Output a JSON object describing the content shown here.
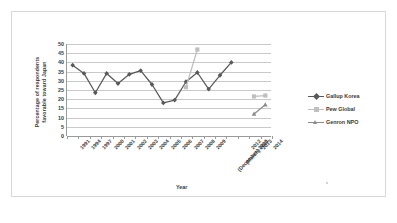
{
  "chart_data": {
    "type": "line",
    "title": "",
    "xlabel": "Year",
    "ylabel": "Percentage of respondents favorable toward Japan",
    "ylim": [
      0,
      50
    ],
    "ytick_step": 5,
    "yticks": [
      "50",
      "45",
      "40",
      "35",
      "30",
      "25",
      "20",
      "15",
      "10",
      "5",
      "0"
    ],
    "grid": "horizontal",
    "legend_position": "right",
    "categories": [
      "1991",
      "1994",
      "1997",
      "2000",
      "2001",
      "2002",
      "2003",
      "2004",
      "2005",
      "2006",
      "2007",
      "2008",
      "2009",
      "(December) 2010",
      "(March) 2011",
      "2012",
      "2013",
      "2014"
    ],
    "series": [
      {
        "name": "Gallup Korea",
        "color": "#595959",
        "marker": "diamond",
        "values": [
          38.5,
          34,
          23.5,
          34,
          28.5,
          33.5,
          35.5,
          28,
          18,
          19.5,
          29.5,
          34.5,
          25.5,
          33,
          40,
          null,
          null,
          null
        ]
      },
      {
        "name": "Pew Global",
        "color": "#bfbfbf",
        "marker": "square",
        "values": [
          null,
          null,
          null,
          null,
          null,
          null,
          null,
          null,
          null,
          null,
          26.5,
          47,
          null,
          null,
          null,
          null,
          21.5,
          22
        ]
      },
      {
        "name": "Genron NPO",
        "color": "#8c8c8c",
        "marker": "triangle",
        "values": [
          null,
          null,
          null,
          null,
          null,
          null,
          null,
          null,
          null,
          null,
          null,
          null,
          null,
          null,
          null,
          null,
          12,
          17
        ]
      }
    ]
  },
  "legend": {
    "items": [
      {
        "label": "Gallup Korea"
      },
      {
        "label": "Pew Global"
      },
      {
        "label": "Genron NPO"
      }
    ]
  },
  "axis_titles": {
    "y_line1": "Percentage of respondents",
    "y_line2": "favorable toward Japan",
    "x": "Year"
  }
}
